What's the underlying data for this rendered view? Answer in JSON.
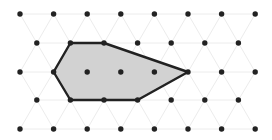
{
  "diagram": {
    "title": "",
    "type": "triangular-lattice-polygon",
    "colors": {
      "background": "#ffffff",
      "lattice_line": "#ececec",
      "dot": "#222222",
      "polygon_fill": "#d2d2d2",
      "polygon_stroke": "#222222"
    },
    "lattice": {
      "rows": [
        {
          "y": 14,
          "xs": [
            20,
            53.6,
            87.2,
            120.8,
            154.4,
            188,
            221.6,
            255.2
          ]
        },
        {
          "y": 43,
          "xs": [
            36.8,
            70.4,
            104,
            137.6,
            171.2,
            204.8,
            238.4
          ]
        },
        {
          "y": 72,
          "xs": [
            20,
            53.6,
            87.2,
            120.8,
            154.4,
            188,
            221.6,
            255.2
          ]
        },
        {
          "y": 100,
          "xs": [
            36.8,
            70.4,
            104,
            137.6,
            171.2,
            204.8,
            238.4
          ]
        },
        {
          "y": 129,
          "xs": [
            20,
            53.6,
            87.2,
            120.8,
            154.4,
            188,
            221.6,
            255.2
          ]
        }
      ]
    },
    "polygon": {
      "vertices": [
        [
          70.4,
          43
        ],
        [
          104,
          43
        ],
        [
          188,
          72
        ],
        [
          137.6,
          100
        ],
        [
          70.4,
          100
        ],
        [
          53.6,
          72
        ]
      ]
    }
  }
}
